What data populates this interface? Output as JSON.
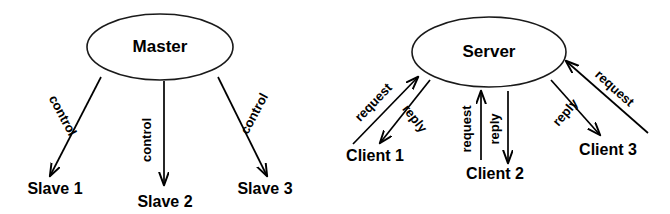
{
  "canvas": {
    "width": 670,
    "height": 214,
    "background": "#ffffff",
    "stroke_color": "#000000",
    "node_fill": "#ffffff"
  },
  "diagrams": [
    {
      "id": "master-slave",
      "hub": {
        "label": "Master",
        "cx": 160,
        "cy": 47,
        "rx": 73,
        "ry": 33
      },
      "leaves": [
        {
          "label": "Slave 1",
          "x": 55,
          "y": 190
        },
        {
          "label": "Slave 2",
          "x": 165,
          "y": 203
        },
        {
          "label": "Slave 3",
          "x": 265,
          "y": 190
        }
      ],
      "edges": [
        {
          "label": "control",
          "from": "Master",
          "to": "Slave 1",
          "direction": "down-left",
          "x1": 101,
          "y1": 77,
          "x2": 50,
          "y2": 176,
          "label_x": 62,
          "label_y": 116,
          "rotate": 62
        },
        {
          "label": "control",
          "from": "Master",
          "to": "Slave 2",
          "direction": "down",
          "x1": 164,
          "y1": 81,
          "x2": 164,
          "y2": 185,
          "label_x": 148,
          "label_y": 140,
          "rotate": -90
        },
        {
          "label": "control",
          "from": "Master",
          "to": "Slave 3",
          "direction": "down-right",
          "x1": 218,
          "y1": 77,
          "x2": 267,
          "y2": 176,
          "label_x": 255,
          "label_y": 114,
          "rotate": -62
        }
      ]
    },
    {
      "id": "client-server",
      "hub": {
        "label": "Server",
        "cx": 489,
        "cy": 52,
        "rx": 77,
        "ry": 35
      },
      "leaves": [
        {
          "label": "Client 1",
          "x": 375,
          "y": 157
        },
        {
          "label": "Client 2",
          "x": 495,
          "y": 175
        },
        {
          "label": "Client 3",
          "x": 608,
          "y": 151
        }
      ],
      "edges": [
        {
          "label": "request",
          "from": "Client 1",
          "to": "Server",
          "direction": "up-right",
          "x1": 353,
          "y1": 144,
          "x2": 418,
          "y2": 77,
          "label_x": 374,
          "label_y": 103,
          "rotate": -46
        },
        {
          "label": "reply",
          "from": "Server",
          "to": "Client 1",
          "direction": "down-left",
          "x1": 430,
          "y1": 80,
          "x2": 380,
          "y2": 143,
          "label_x": 414,
          "label_y": 119,
          "rotate": 52
        },
        {
          "label": "request",
          "from": "Client 2",
          "to": "Server",
          "direction": "up",
          "x1": 481,
          "y1": 160,
          "x2": 481,
          "y2": 91,
          "label_x": 468,
          "label_y": 129,
          "rotate": -90
        },
        {
          "label": "reply",
          "from": "Server",
          "to": "Client 2",
          "direction": "down",
          "x1": 508,
          "y1": 91,
          "x2": 508,
          "y2": 163,
          "label_x": 496,
          "label_y": 129,
          "rotate": -90
        },
        {
          "label": "request",
          "from": "Client 3",
          "to": "Server",
          "direction": "up-left",
          "x1": 648,
          "y1": 133,
          "x2": 566,
          "y2": 61,
          "label_x": 614,
          "label_y": 89,
          "rotate": 42
        },
        {
          "label": "reply",
          "from": "Server",
          "to": "Client 3",
          "direction": "down-right",
          "x1": 551,
          "y1": 80,
          "x2": 600,
          "y2": 135,
          "label_x": 566,
          "label_y": 113,
          "rotate": -49
        }
      ]
    }
  ]
}
